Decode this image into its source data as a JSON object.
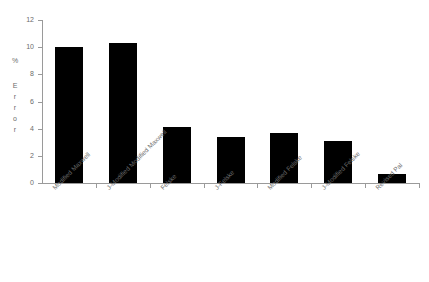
{
  "chart_data": {
    "type": "bar",
    "title": "",
    "xlabel": "",
    "ylabel": "% Error",
    "ylabel_parts": [
      "%",
      "E",
      "r",
      "r",
      "o",
      "r"
    ],
    "categories": [
      "Modified Maxwell",
      "J-Modified Modified Maxwell",
      "Felske",
      "J-Felske",
      "Modified Felske",
      "J-Modified Felske",
      "Revised Pal"
    ],
    "values": [
      10.0,
      10.3,
      4.1,
      3.4,
      3.7,
      3.1,
      0.65
    ],
    "ylim": [
      0,
      12
    ],
    "yticks": [
      0,
      2,
      4,
      6,
      8,
      10,
      12
    ],
    "ytick_labels": [
      "0",
      "2",
      "4",
      "6",
      "8",
      "10",
      "12"
    ],
    "grid": false,
    "legend": null,
    "bar_color": "#000000",
    "axis_color": "#9a9a9a",
    "text_color": "#6b6b6b",
    "background": "#ffffff"
  }
}
